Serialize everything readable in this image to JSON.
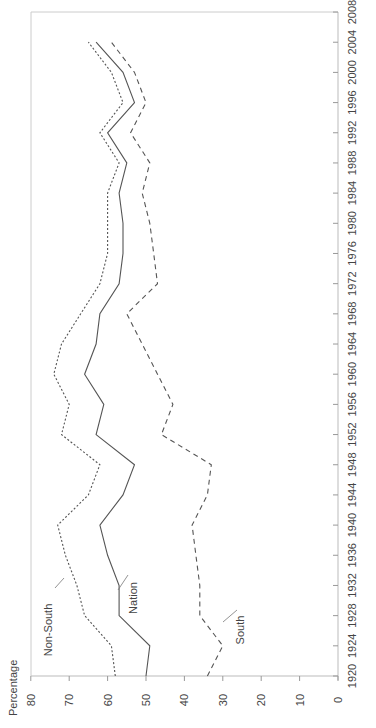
{
  "chart_data": {
    "type": "line",
    "orientation": "rotated-90-ccw",
    "title": "",
    "xlabel": "",
    "ylabel": "Percentage",
    "ylim": [
      0,
      80
    ],
    "xlim": [
      1920,
      2008
    ],
    "yticks": [
      0,
      10,
      20,
      30,
      40,
      50,
      60,
      70,
      80
    ],
    "xticks": [
      1920,
      1924,
      1928,
      1932,
      1936,
      1940,
      1944,
      1948,
      1952,
      1956,
      1960,
      1964,
      1968,
      1972,
      1976,
      1980,
      1984,
      1988,
      1992,
      1996,
      2000,
      2004,
      2008
    ],
    "grid": false,
    "legend": "inline-labels",
    "x": [
      1920,
      1924,
      1928,
      1932,
      1936,
      1940,
      1944,
      1948,
      1952,
      1956,
      1960,
      1964,
      1968,
      1972,
      1976,
      1980,
      1984,
      1988,
      1992,
      1996,
      2000,
      2004
    ],
    "series": [
      {
        "name": "Non-South",
        "style": "dotted",
        "values": [
          58,
          59,
          66,
          68,
          71,
          73,
          65,
          62,
          72,
          70,
          74,
          72,
          67,
          62,
          60,
          60,
          60,
          57,
          62,
          56,
          59,
          65
        ]
      },
      {
        "name": "Nation",
        "style": "solid",
        "values": [
          50,
          49,
          57,
          57,
          60,
          62,
          56,
          53,
          63,
          61,
          66,
          63,
          62,
          57,
          56,
          56,
          57,
          55,
          60,
          53,
          56,
          63
        ]
      },
      {
        "name": "South",
        "style": "dashed",
        "values": [
          34,
          30,
          36,
          36,
          37,
          38,
          34,
          33,
          46,
          43,
          47,
          51,
          55,
          47,
          48,
          49,
          51,
          49,
          54,
          50,
          53,
          59
        ]
      }
    ]
  }
}
